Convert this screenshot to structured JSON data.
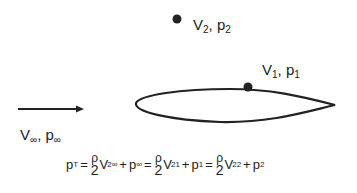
{
  "diagram": {
    "freestream": {
      "velocity": "V",
      "velocity_sub": "∞",
      "pressure": "p",
      "pressure_sub": "∞"
    },
    "point1": {
      "velocity": "V",
      "velocity_sub": "1",
      "pressure": "p",
      "pressure_sub": "1"
    },
    "point2": {
      "velocity": "V",
      "velocity_sub": "2",
      "pressure": "p",
      "pressure_sub": "2"
    },
    "sep": ",",
    "equation": {
      "lhs": "p",
      "lhs_sub": "T",
      "eq": "=",
      "rho": "ρ",
      "two": "2",
      "plus": "+",
      "terms": [
        {
          "v": "V",
          "vsub": "∞",
          "sq": "2",
          "p": "p",
          "psub": "∞"
        },
        {
          "v": "V",
          "vsub": "1",
          "sq": "2",
          "p": "p",
          "psub": "1"
        },
        {
          "v": "V",
          "vsub": "2",
          "sq": "2",
          "p": "p",
          "psub": "2"
        }
      ]
    },
    "colors": {
      "ink": "#222222",
      "background": "#ffffff"
    }
  }
}
